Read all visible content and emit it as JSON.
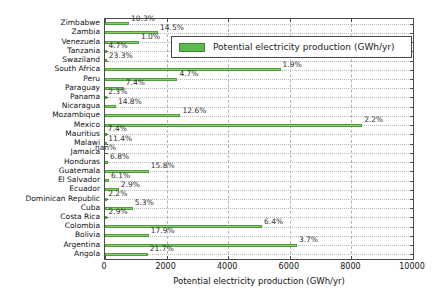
{
  "chart_data": {
    "type": "bar",
    "orientation": "horizontal",
    "title": "",
    "xlabel": "Potential electricity production (GWh/yr)",
    "ylabel": "",
    "xlim": [
      0,
      10000
    ],
    "x_ticks": [
      0,
      2000,
      4000,
      6000,
      8000,
      10000
    ],
    "x_tick_labels": [
      "0",
      "2000",
      "4000",
      "6000",
      "8000",
      "10000"
    ],
    "grid": "dashed vertical at major x ticks, dotted horizontal per category",
    "legend": {
      "label": "Potential electricity production (GWh/yr)",
      "position": "upper right"
    },
    "colors": {
      "bar_fill": "#8accx72",
      "bar_fill_hex": "#8acc72",
      "bar_edge": "#4f9e3d",
      "legend_swatch": "#5fba4c",
      "legend_swatch_edge": "#3e8c30",
      "axis": "#4a4a4a",
      "grid": "#b4b4b4"
    },
    "categories": [
      "Zimbabwe",
      "Zambia",
      "Venezuela",
      "Tanzania",
      "Swaziland",
      "South Africa",
      "Peru",
      "Paraguay",
      "Panama",
      "Nicaragua",
      "Mozambique",
      "Mexico",
      "Mauritius",
      "Malawi",
      "Jamaica",
      "Honduras",
      "Guatemala",
      "El Salvador",
      "Ecuador",
      "Dominican Republic",
      "Cuba",
      "Costa Rica",
      "Colombia",
      "Bolivia",
      "Argentina",
      "Angola"
    ],
    "series": [
      {
        "name": "Potential electricity production (GWh/yr)",
        "values": [
          780,
          1720,
          1100,
          50,
          60,
          5700,
          2350,
          610,
          40,
          355,
          2450,
          8350,
          25,
          40,
          null,
          100,
          1420,
          130,
          450,
          40,
          900,
          50,
          5100,
          1420,
          6230,
          1390
        ],
        "point_labels": [
          "10.3%",
          "14.5%",
          "1.0%",
          "4.7%",
          "23.3%",
          "1.9%",
          "4.7%",
          "7.4%",
          "2.3%",
          "14.8%",
          "12.6%",
          "2.2%",
          "7.4%",
          "11.4%",
          "nan%",
          "6.8%",
          "15.8%",
          "6.1%",
          "2.9%",
          "2.2%",
          "5.3%",
          "2.9%",
          "6.4%",
          "17.9%",
          "3.7%",
          "21.7%"
        ]
      }
    ]
  }
}
